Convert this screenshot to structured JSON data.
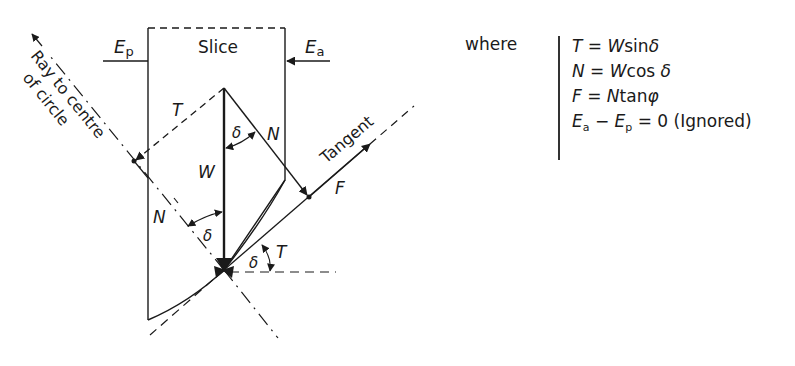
{
  "figure": {
    "slice_label": "Slice",
    "ep_label": {
      "main": "E",
      "sub": "p"
    },
    "ea_label": {
      "main": "E",
      "sub": "a"
    },
    "ray_label_line1": "Ray to centre",
    "ray_label_line2": "of circle",
    "tangent_label": "Tangent",
    "force_labels": {
      "T_upper": "T",
      "N_upper": "N",
      "W": "W",
      "N_lower": "N",
      "F": "F",
      "T_lower": "T"
    },
    "angle_labels": {
      "delta_upper": "δ",
      "delta_lower_left": "δ",
      "delta_lower_right": "δ"
    }
  },
  "equations": {
    "where_label": "where",
    "rows": [
      {
        "lhs": "T",
        "rhs_var": "W",
        "rhs_fn": "sin",
        "rhs_sym": "δ"
      },
      {
        "lhs": "N",
        "rhs_var": "W",
        "rhs_fn": "cos",
        "rhs_sym": "δ"
      },
      {
        "lhs": "F",
        "rhs_var": "N",
        "rhs_fn": "tan",
        "rhs_sym": "φ"
      }
    ],
    "last_row": {
      "a": "E",
      "a_sub": "a",
      "minus": "−",
      "b": "E",
      "b_sub": "p",
      "rhs": "= 0 (Ignored)"
    }
  }
}
